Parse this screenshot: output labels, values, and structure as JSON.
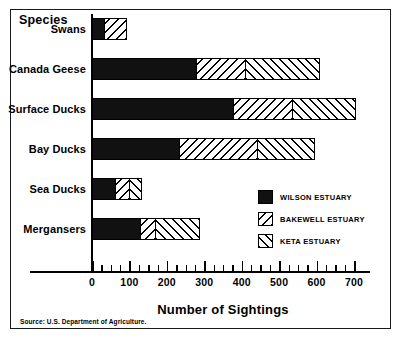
{
  "figure": {
    "species_axis_title": "Species",
    "x_axis_title": "Number of Sightings",
    "source_note": "Source: U.S. Department of Agriculture."
  },
  "legend": {
    "items": [
      {
        "label": "WILSON ESTUARY",
        "pattern": "solid-black",
        "color": "#111111"
      },
      {
        "label": "BAKEWELL ESTUARY",
        "pattern": "backslash-hatch",
        "color": "#000000"
      },
      {
        "label": "KETA ESTUARY",
        "pattern": "forwardslash-hatch",
        "color": "#000000"
      }
    ]
  },
  "chart_data": {
    "type": "bar",
    "orientation": "horizontal",
    "stacked": true,
    "title": "",
    "xlabel": "Number of Sightings",
    "ylabel": "Species",
    "xlim": [
      0,
      700
    ],
    "xticks": [
      0,
      100,
      200,
      300,
      400,
      500,
      600,
      700
    ],
    "xtick_labels": [
      "0",
      "100",
      "200",
      "300",
      "400",
      "500",
      "600",
      "700"
    ],
    "minor_tick_interval": 25,
    "grid": false,
    "legend_position": "inside-right-lower",
    "categories": [
      "Swans",
      "Canada Geese",
      "Surface Ducks",
      "Bay Ducks",
      "Sea Ducks",
      "Mergansers"
    ],
    "series": [
      {
        "name": "WILSON ESTUARY",
        "values": [
          35,
          280,
          380,
          235,
          65,
          130
        ]
      },
      {
        "name": "BAKEWELL ESTUARY",
        "values": [
          60,
          135,
          160,
          210,
          40,
          45
        ]
      },
      {
        "name": "KETA ESTUARY",
        "values": [
          0,
          200,
          170,
          155,
          35,
          120
        ]
      }
    ],
    "totals": [
      95,
      615,
      710,
      600,
      140,
      295
    ]
  }
}
